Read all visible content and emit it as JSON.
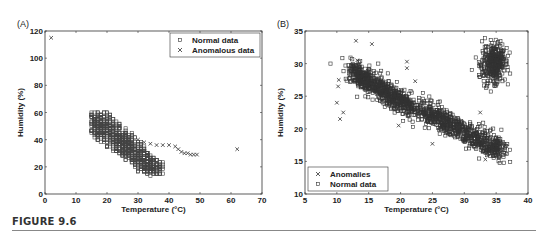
{
  "figure": {
    "label": "FIGURE 9.6"
  },
  "chart_data": [
    {
      "panel": "(A)",
      "type": "scatter",
      "xlabel": "Temperature (°C)",
      "ylabel": "Humidity (%)",
      "xlim": [
        0,
        70
      ],
      "ylim": [
        0,
        120
      ],
      "xticks": [
        0,
        10,
        20,
        30,
        40,
        50,
        60,
        70
      ],
      "yticks": [
        0,
        20,
        40,
        60,
        80,
        100,
        120
      ],
      "grid": false,
      "legend_position": "top-right",
      "series": [
        {
          "name": "Normal data",
          "marker": "square",
          "region": "dense band from (15,60) down to (37,15)",
          "approx_points": [
            [
              15,
              55
            ],
            [
              16,
              60
            ],
            [
              18,
              60
            ],
            [
              17,
              50
            ],
            [
              20,
              45
            ],
            [
              22,
              40
            ],
            [
              25,
              35
            ],
            [
              28,
              30
            ],
            [
              30,
              25
            ],
            [
              32,
              22
            ],
            [
              35,
              18
            ],
            [
              37,
              20
            ],
            [
              35,
              15
            ],
            [
              20,
              30
            ],
            [
              25,
              25
            ],
            [
              30,
              20
            ],
            [
              18,
              40
            ],
            [
              22,
              48
            ],
            [
              27,
              38
            ],
            [
              33,
              28
            ]
          ]
        },
        {
          "name": "Anomalous data",
          "marker": "x",
          "approx_points": [
            [
              2,
              115
            ],
            [
              30,
              40
            ],
            [
              32,
              38
            ],
            [
              34,
              37
            ],
            [
              36,
              36
            ],
            [
              38,
              36
            ],
            [
              40,
              36
            ],
            [
              42,
              35
            ],
            [
              43,
              33
            ],
            [
              44,
              31
            ],
            [
              45,
              30
            ],
            [
              46,
              30
            ],
            [
              47,
              29
            ],
            [
              48,
              29
            ],
            [
              49,
              29
            ],
            [
              62,
              33
            ]
          ]
        }
      ]
    },
    {
      "panel": "(B)",
      "type": "scatter",
      "xlabel": "Temperature (°C)",
      "ylabel": "Humidity (%)",
      "xlim": [
        5,
        40
      ],
      "ylim": [
        10,
        35
      ],
      "xticks": [
        5,
        10,
        15,
        20,
        25,
        30,
        35,
        40
      ],
      "yticks": [
        10,
        15,
        20,
        25,
        30,
        35
      ],
      "grid": false,
      "legend_position": "bottom-left",
      "series": [
        {
          "name": "Anomalies",
          "marker": "x",
          "approx_points": [
            [
              10.5,
              21.5
            ],
            [
              11,
              22.5
            ],
            [
              10,
              24
            ],
            [
              10.2,
              26.5
            ],
            [
              10.3,
              27.5
            ],
            [
              13,
              33.5
            ],
            [
              15.5,
              33
            ],
            [
              13.2,
              30.5
            ],
            [
              19.7,
              20.5
            ],
            [
              21,
              30.3
            ],
            [
              21,
              29.3
            ],
            [
              22.3,
              27.3
            ],
            [
              25,
              17.7
            ],
            [
              32.5,
              22.5
            ],
            [
              33.3,
              15.3
            ]
          ]
        },
        {
          "name": "Normal data",
          "marker": "square",
          "clusters": [
            {
              "center": [
                16,
                26
              ],
              "desc": "elongated cluster from (12,29) to (22,23)"
            },
            {
              "center": [
                30,
                20
              ],
              "desc": "elongated cluster from (23,23) to (36,16)"
            },
            {
              "center": [
                34.5,
                30
              ],
              "desc": "round cluster ~(33-37, 27-33)"
            }
          ],
          "outliers": [
            [
              9,
              30
            ],
            [
              16.5,
              30
            ],
            [
              18,
              28.5
            ],
            [
              23.5,
              25.5
            ],
            [
              36.2,
              14.8
            ],
            [
              37.2,
              14.9
            ]
          ]
        }
      ]
    }
  ]
}
